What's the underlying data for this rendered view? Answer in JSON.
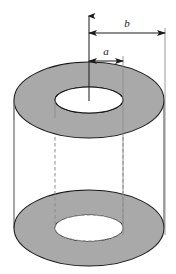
{
  "figure": {
    "kind": "annular-cylinder-diagram",
    "labels": {
      "inner_radius": "a",
      "outer_radius": "b"
    },
    "axis": {
      "name": "central-axis",
      "arrow_direction": "up"
    },
    "colors": {
      "shaded_face": "#a9a9a9",
      "outline": "#1a1a1a",
      "hidden_line": "#8c8c8c",
      "extension_line": "#8c8c8c",
      "background": "#ffffff",
      "label_text": "#1a1a1a"
    },
    "geometry": {
      "top_face_center_x": 89,
      "top_face_center_y": 100,
      "bottom_face_center_x": 89,
      "bottom_face_center_y": 228,
      "outer_rx": 75,
      "outer_ry": 38,
      "inner_rx": 34,
      "inner_ry": 13,
      "dim_b_y": 33,
      "dim_a_y": 61,
      "dim_b_right_x": 165,
      "dim_a_right_x": 123
    }
  }
}
